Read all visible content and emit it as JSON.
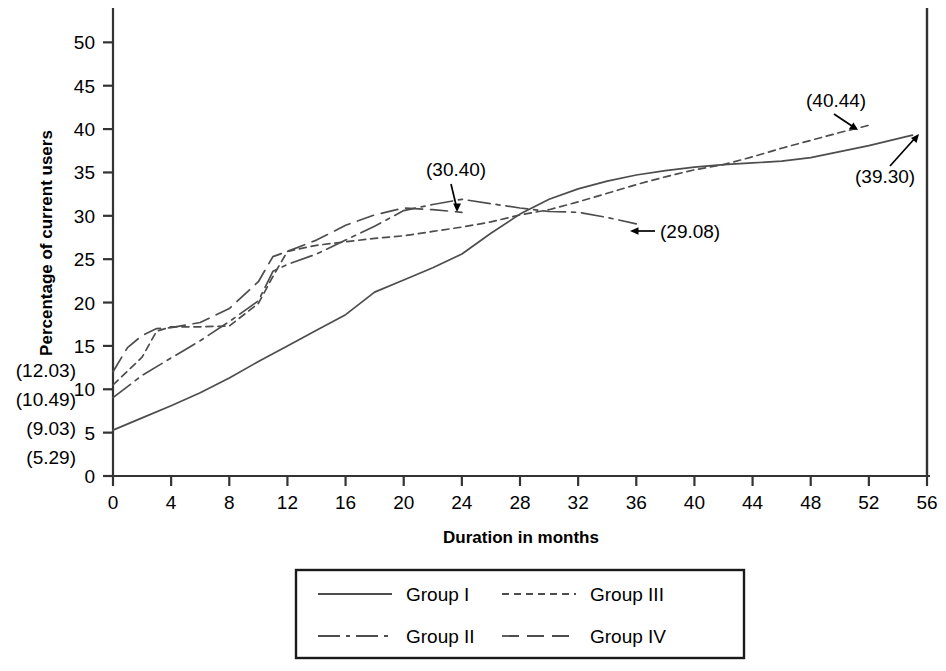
{
  "chart_data": {
    "type": "line",
    "title": "",
    "xlabel": "Duration in months",
    "ylabel": "Percentage of current users",
    "xlim": [
      0,
      56
    ],
    "ylim": [
      0,
      52
    ],
    "xticks": [
      0,
      4,
      8,
      12,
      16,
      20,
      24,
      28,
      32,
      36,
      40,
      44,
      48,
      52,
      56
    ],
    "yticks": [
      0,
      5,
      10,
      15,
      20,
      25,
      30,
      35,
      40,
      45,
      50
    ],
    "grid": false,
    "legend_position": "bottom",
    "series": [
      {
        "name": "Group I",
        "style": "solid",
        "x": [
          0,
          2,
          4,
          6,
          8,
          10,
          12,
          14,
          16,
          18,
          20,
          22,
          24,
          26,
          28,
          30,
          32,
          34,
          36,
          38,
          40,
          42,
          44,
          46,
          48,
          50,
          52,
          54,
          55
        ],
        "y": [
          5.29,
          6.7,
          8.1,
          9.6,
          11.3,
          13.2,
          15.0,
          16.8,
          18.6,
          21.2,
          22.6,
          24.0,
          25.6,
          28.0,
          30.2,
          31.9,
          33.1,
          34.0,
          34.7,
          35.2,
          35.6,
          35.9,
          36.1,
          36.3,
          36.7,
          37.4,
          38.1,
          38.9,
          39.3
        ]
      },
      {
        "name": "Group II",
        "style": "dashdot",
        "x": [
          0,
          2,
          4,
          6,
          8,
          10,
          11,
          12,
          14,
          16,
          18,
          20,
          22,
          24,
          26,
          28,
          30,
          32,
          34,
          36
        ],
        "y": [
          9.03,
          11.6,
          13.6,
          15.6,
          17.8,
          20.2,
          23.6,
          24.4,
          25.6,
          27.2,
          28.8,
          30.6,
          31.3,
          31.9,
          31.4,
          30.9,
          30.5,
          30.4,
          29.8,
          29.08
        ]
      },
      {
        "name": "Group III",
        "style": "dotted",
        "x": [
          0,
          2,
          3,
          4,
          6,
          8,
          10,
          11,
          12,
          14,
          16,
          18,
          20,
          22,
          24,
          26,
          28,
          30,
          32,
          34,
          36,
          38,
          40,
          42,
          44,
          46,
          48,
          50,
          52
        ],
        "y": [
          10.49,
          13.7,
          16.7,
          17.2,
          17.2,
          17.3,
          19.9,
          23.0,
          25.9,
          26.6,
          27.0,
          27.4,
          27.7,
          28.2,
          28.7,
          29.3,
          30.1,
          30.7,
          31.6,
          32.6,
          33.6,
          34.5,
          35.3,
          35.9,
          36.8,
          37.8,
          38.7,
          39.6,
          40.44
        ]
      },
      {
        "name": "Group IV",
        "style": "dashed",
        "x": [
          0,
          1,
          2,
          3,
          4,
          6,
          8,
          10,
          11,
          12,
          14,
          16,
          18,
          20,
          22,
          24
        ],
        "y": [
          12.03,
          14.8,
          16.2,
          17.0,
          17.1,
          17.7,
          19.3,
          22.4,
          25.3,
          25.9,
          27.2,
          28.9,
          30.1,
          30.9,
          30.7,
          30.4
        ]
      }
    ],
    "left_annotations": [
      "(12.03)",
      "(10.49)",
      "(9.03)",
      "(5.29)"
    ],
    "point_annotations": [
      {
        "label": "(30.40)",
        "x": 24,
        "y": 30.4
      },
      {
        "label": "(29.08)",
        "x": 36,
        "y": 29.08
      },
      {
        "label": "(40.44)",
        "x": 52,
        "y": 40.44
      },
      {
        "label": "(39.30)",
        "x": 55,
        "y": 39.3
      }
    ]
  },
  "axis": {
    "ylabel": "Percentage of current users",
    "xlabel": "Duration in months",
    "yticks": [
      "0",
      "5",
      "10",
      "15",
      "20",
      "25",
      "30",
      "35",
      "40",
      "45",
      "50"
    ],
    "xticks": [
      "0",
      "4",
      "8",
      "12",
      "16",
      "20",
      "24",
      "28",
      "32",
      "36",
      "40",
      "44",
      "48",
      "52",
      "56"
    ]
  },
  "left_annotations": {
    "a1": "(12.03)",
    "a2": "(10.49)",
    "a3": "(9.03)",
    "a4": "(5.29)"
  },
  "annotations": {
    "g4_peak": "(30.40)",
    "g2_end": "(29.08)",
    "g3_end": "(40.44)",
    "g1_end": "(39.30)"
  },
  "legend": {
    "items": [
      {
        "label": "Group I",
        "style": "solid"
      },
      {
        "label": "Group II",
        "style": "dashdot"
      },
      {
        "label": "Group III",
        "style": "dotted"
      },
      {
        "label": "Group IV",
        "style": "dashed"
      }
    ]
  },
  "colors": {
    "line": "#4d4d4d",
    "axis": "#1a1a1a",
    "text": "#000000"
  }
}
